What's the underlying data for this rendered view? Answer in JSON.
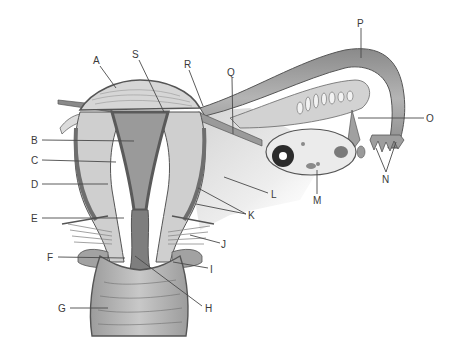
{
  "diagram": {
    "colors": {
      "background": "#ffffff",
      "outline": "#555555",
      "muscle_light": "#d9d9d9",
      "muscle_mid": "#a8a8a8",
      "muscle_dark": "#6e6e6e",
      "cavity": "#9a9a9a",
      "ligament": "#e6e6e6",
      "follicle_dark": "#2b2b2b",
      "label_text": "#3a3a3a"
    },
    "labels": [
      {
        "id": "A",
        "text": "A",
        "x": 96,
        "y": 63,
        "target": [
          116,
          88
        ]
      },
      {
        "id": "S",
        "text": "S",
        "x": 136,
        "y": 57,
        "target": [
          164,
          115
        ]
      },
      {
        "id": "R",
        "text": "R",
        "x": 186,
        "y": 67,
        "target": [
          203,
          108
        ]
      },
      {
        "id": "Q",
        "text": "Q",
        "x": 229,
        "y": 75,
        "target": [
          233,
          134
        ]
      },
      {
        "id": "P",
        "text": "P",
        "x": 361,
        "y": 26,
        "target": [
          361,
          58
        ]
      },
      {
        "id": "O",
        "text": "O",
        "x": 430,
        "y": 118,
        "target": [
          358,
          118
        ]
      },
      {
        "id": "N",
        "text": "N",
        "x": 386,
        "y": 181,
        "target_a": [
          376,
          148
        ],
        "target_b": [
          396,
          142
        ]
      },
      {
        "id": "M",
        "text": "M",
        "x": 317,
        "y": 202,
        "target": [
          317,
          169
        ]
      },
      {
        "id": "L",
        "text": "L",
        "x": 274,
        "y": 194,
        "target": [
          224,
          177
        ]
      },
      {
        "id": "K",
        "text": "K",
        "x": 250,
        "y": 215,
        "target_a": [
          198,
          188
        ],
        "target_b": [
          196,
          204
        ]
      },
      {
        "id": "J",
        "text": "J",
        "x": 224,
        "y": 243,
        "target": [
          190,
          235
        ]
      },
      {
        "id": "I",
        "text": "I",
        "x": 212,
        "y": 269,
        "target": [
          173,
          262
        ]
      },
      {
        "id": "H",
        "text": "H",
        "x": 210,
        "y": 308,
        "target": [
          135,
          256
        ]
      },
      {
        "id": "G",
        "text": "G",
        "x": 62,
        "y": 308,
        "target": [
          108,
          308
        ]
      },
      {
        "id": "F",
        "text": "F",
        "x": 50,
        "y": 257,
        "target": [
          125,
          258
        ]
      },
      {
        "id": "E",
        "text": "E",
        "x": 34,
        "y": 218,
        "target": [
          124,
          218
        ]
      },
      {
        "id": "D",
        "text": "D",
        "x": 34,
        "y": 184,
        "target": [
          108,
          184
        ]
      },
      {
        "id": "C",
        "text": "C",
        "x": 34,
        "y": 160,
        "target": [
          116,
          162
        ]
      },
      {
        "id": "B",
        "text": "B",
        "x": 34,
        "y": 140,
        "target": [
          134,
          141
        ]
      }
    ]
  }
}
